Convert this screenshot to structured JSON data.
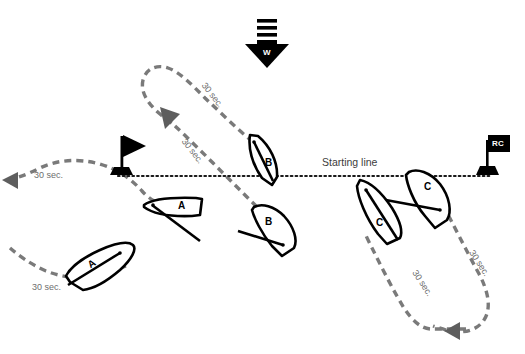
{
  "diagram": {
    "background_color": "#ffffff",
    "track_color": "#7a7a7a",
    "line_color": "#000000",
    "start_line": {
      "label": "Starting line",
      "style": "dotted",
      "y": 176,
      "x_start": 118,
      "x_end": 492
    },
    "wind": {
      "marker_label": "W",
      "direction": "down",
      "stripes": 3
    },
    "marks": [
      {
        "name": "pin-end-flag",
        "label": "",
        "x": 122,
        "y": 152
      },
      {
        "name": "race-committee-flag",
        "label": "RC",
        "x": 487,
        "y": 150
      }
    ],
    "boats": [
      {
        "id": "A",
        "position": "upper",
        "heading": "west",
        "x": 178,
        "y": 208
      },
      {
        "id": "A",
        "position": "lower",
        "heading": "northeast",
        "x": 92,
        "y": 263
      },
      {
        "id": "B",
        "position": "upper",
        "heading": "north",
        "x": 268,
        "y": 160
      },
      {
        "id": "B",
        "position": "lower",
        "heading": "southeast",
        "x": 267,
        "y": 222
      },
      {
        "id": "C",
        "position": "upper",
        "heading": "southeast",
        "x": 427,
        "y": 186
      },
      {
        "id": "C",
        "position": "lower",
        "heading": "northwest",
        "x": 381,
        "y": 223
      }
    ],
    "time_labels": [
      {
        "text": "30 sec.",
        "x": 34,
        "y": 176,
        "rotation": 0,
        "track": "boat-a-outbound"
      },
      {
        "text": "30 sec.",
        "x": 32,
        "y": 288,
        "rotation": 0,
        "track": "boat-a-return"
      },
      {
        "text": "30 sec.",
        "x": 205,
        "y": 97,
        "rotation": 52,
        "track": "boat-b-outbound"
      },
      {
        "text": "30 sec.",
        "x": 190,
        "y": 154,
        "rotation": 52,
        "track": "boat-b-return"
      },
      {
        "text": "30 sec.",
        "x": 418,
        "y": 284,
        "rotation": 57,
        "track": "boat-c-outbound"
      },
      {
        "text": "30 sec.",
        "x": 474,
        "y": 266,
        "rotation": 57,
        "track": "boat-c-return"
      }
    ],
    "arrow_heads": [
      {
        "name": "boat-a-track-arrow",
        "x": 8,
        "y": 180,
        "direction": "west"
      },
      {
        "name": "boat-b-track-arrow",
        "x": 168,
        "y": 117,
        "direction": "southwest"
      },
      {
        "name": "boat-c-track-arrow",
        "x": 470,
        "y": 331,
        "direction": "west"
      }
    ]
  }
}
